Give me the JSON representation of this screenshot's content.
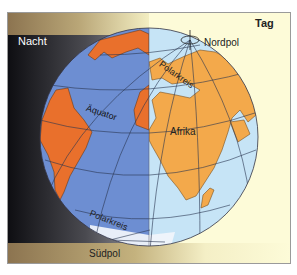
{
  "labels": {
    "night": "Nacht",
    "day": "Tag",
    "north_pole": "Nordpol",
    "south_pole": "Südpol",
    "arctic_circle": "Polarkreis",
    "antarctic_circle": "Polarkreis",
    "equator": "Äquator",
    "africa": "Afrika"
  },
  "colors": {
    "night_ocean": "#6d8ed2",
    "night_land": "#e9702c",
    "day_ocean": "#c6e4f6",
    "day_land": "#f3a94b",
    "day_background": "#fdfbd8",
    "night_background_dark": "#141418",
    "night_background_light": "#8a8a8e",
    "bar_gold": "#c9b27a"
  }
}
